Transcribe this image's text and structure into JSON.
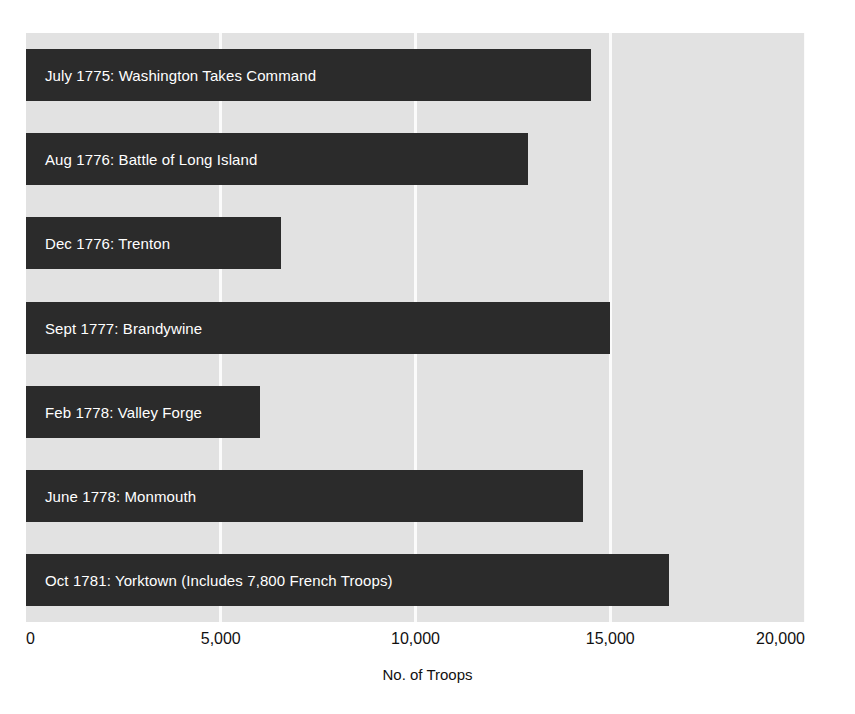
{
  "chart_data": {
    "type": "bar",
    "orientation": "horizontal",
    "title": "",
    "xlabel": "No. of  Troops",
    "ylabel": "",
    "xlim": [
      0,
      20000
    ],
    "xticks": [
      0,
      5000,
      10000,
      15000,
      20000
    ],
    "xtick_labels": [
      "0",
      "5,000",
      "10,000",
      "15,000",
      "20,000"
    ],
    "grid": true,
    "grid_axis": "x",
    "legend": false,
    "categories": [
      "July 1775: Washington Takes Command",
      "Aug 1776: Battle of Long Island",
      "Dec 1776: Trenton",
      "Sept 1777: Brandywine",
      "Feb 1778: Valley Forge",
      "June 1778: Monmouth",
      "Oct 1781: Yorktown (Includes 7,800 French Troops)"
    ],
    "values": [
      14500,
      12900,
      6550,
      15000,
      6000,
      14300,
      16500
    ],
    "bar_color": "#2b2b2b",
    "label_color": "#ffffff",
    "plot_background": "#e2e2e2",
    "gridline_color": "#fbfbfb"
  },
  "axis": {
    "title": "No. of  Troops",
    "ticks": [
      "0",
      "5,000",
      "10,000",
      "15,000",
      "20,000"
    ]
  }
}
